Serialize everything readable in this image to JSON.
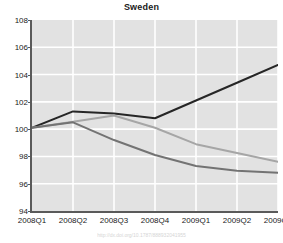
{
  "chart_data": {
    "type": "line",
    "title": "Sweden",
    "xlabel": "",
    "ylabel": "",
    "categories": [
      "2008Q1",
      "2008Q2",
      "2008Q3",
      "2008Q4",
      "2009Q1",
      "2009Q2",
      "2009Q3"
    ],
    "ylim": [
      94,
      108
    ],
    "yticks": [
      94,
      96,
      98,
      100,
      102,
      104,
      106,
      108
    ],
    "grid": true,
    "legend": "none",
    "series": [
      {
        "name": "series-1-dark",
        "color": "#262626",
        "values": [
          100.1,
          101.3,
          101.15,
          100.8,
          102.1,
          103.4,
          104.7
        ]
      },
      {
        "name": "series-2-light-gray",
        "color": "#a6a6a6",
        "values": [
          100.1,
          100.55,
          101.0,
          100.1,
          98.9,
          98.25,
          97.6
        ]
      },
      {
        "name": "series-3-mid-gray",
        "color": "#737373",
        "values": [
          100.1,
          100.5,
          99.2,
          98.1,
          97.3,
          96.95,
          96.8
        ]
      }
    ]
  },
  "footer": {
    "caption": "http://dx.doi.org/10.1787/888932041955"
  },
  "colors": {
    "plot_background": "#e2e2e2",
    "gridline": "#ffffff",
    "axis": "#5a5a5a",
    "text": "#222222"
  }
}
